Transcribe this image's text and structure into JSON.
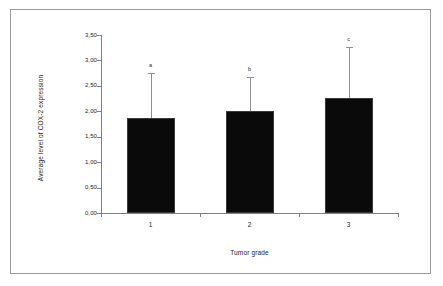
{
  "figure": {
    "background_color": "#ffffff",
    "frame_color": "#9a9a9a",
    "bar_color": "#0a0a0a",
    "axis_color": "#808080",
    "error_bar_color": "#8e8e8e"
  },
  "chart_data": {
    "type": "bar",
    "title": "",
    "xlabel": "Tumor grade",
    "ylabel": "Average level of COX-2 expression",
    "categories": [
      "1",
      "2",
      "3"
    ],
    "values": [
      1.87,
      2.0,
      2.26
    ],
    "error_upper": [
      2.75,
      2.67,
      3.26
    ],
    "annotations": [
      "a",
      "b",
      "c"
    ],
    "ylim": [
      0.0,
      3.5
    ],
    "ytick_values": [
      0.0,
      0.5,
      1.0,
      1.5,
      2.0,
      2.5,
      3.0,
      3.5
    ],
    "ytick_labels": [
      "0,00",
      "0,50",
      "1,00",
      "1,50",
      "2,00",
      "2,50",
      "3,00",
      "3,50"
    ],
    "xtick_labels": [
      "1",
      "2",
      "3"
    ],
    "grid": false,
    "legend": null,
    "decimal_separator": ","
  }
}
